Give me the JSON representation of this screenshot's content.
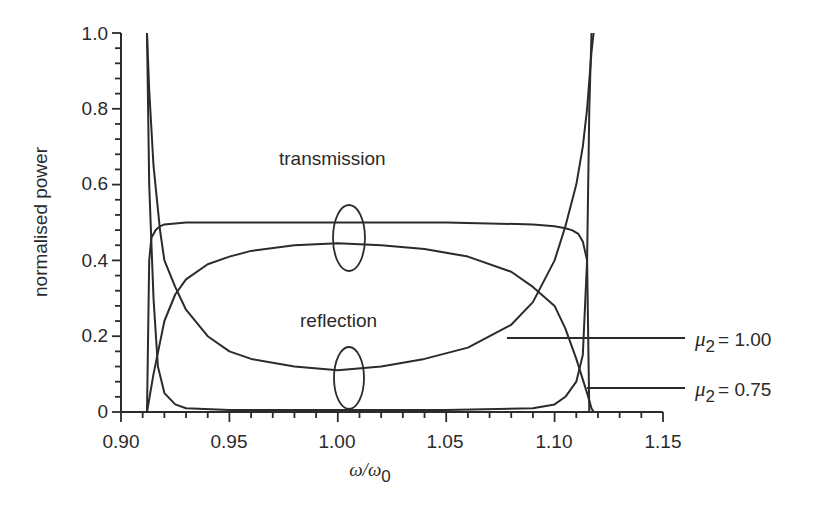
{
  "chart_data": {
    "type": "line",
    "title": "",
    "xlabel": "ω/ω0",
    "xlabel_main": "ω/ω",
    "xlabel_sub": "0",
    "ylabel": "normalised power",
    "xlim": [
      0.9,
      1.15
    ],
    "ylim": [
      0,
      1.0
    ],
    "grid": false,
    "x_ticks": [
      "0.90",
      "0.95",
      "1.00",
      "1.05",
      "1.10",
      "1.15"
    ],
    "x_tick_values": [
      0.9,
      0.95,
      1.0,
      1.05,
      1.1,
      1.15
    ],
    "y_ticks": [
      "0",
      "0.2",
      "0.4",
      "0.6",
      "0.8",
      "1.0"
    ],
    "y_tick_values": [
      0,
      0.2,
      0.4,
      0.6,
      0.8,
      1.0
    ],
    "annotations": {
      "transmission": "transmission",
      "reflection": "reflection",
      "mu_symbol": "μ",
      "mu_sub": "2",
      "mu_100_value": "= 1.00",
      "mu_075_value": "= 0.75"
    },
    "series": [
      {
        "name": "transmission μ2 = 0.75",
        "x": [
          0.912,
          0.913,
          0.914,
          0.916,
          0.918,
          0.92,
          0.93,
          0.95,
          1.0,
          1.05,
          1.09,
          1.1,
          1.105,
          1.108,
          1.111,
          1.113,
          1.115,
          1.116
        ],
        "y": [
          0.0,
          0.4,
          0.46,
          0.48,
          0.49,
          0.495,
          0.5,
          0.5,
          0.5,
          0.5,
          0.495,
          0.49,
          0.485,
          0.48,
          0.47,
          0.45,
          0.4,
          0.0
        ]
      },
      {
        "name": "reflection μ2 = 0.75",
        "x": [
          0.912,
          0.913,
          0.915,
          0.917,
          0.92,
          0.925,
          0.93,
          0.95,
          1.0,
          1.05,
          1.09,
          1.1,
          1.105,
          1.11,
          1.113,
          1.115,
          1.116,
          1.117
        ],
        "y": [
          1.0,
          0.6,
          0.3,
          0.12,
          0.05,
          0.02,
          0.01,
          0.005,
          0.005,
          0.005,
          0.01,
          0.02,
          0.04,
          0.08,
          0.15,
          0.4,
          0.8,
          1.0
        ]
      },
      {
        "name": "transmission μ2 = 1.00",
        "x": [
          0.912,
          0.915,
          0.92,
          0.925,
          0.93,
          0.94,
          0.95,
          0.96,
          0.98,
          1.0,
          1.02,
          1.04,
          1.06,
          1.08,
          1.09,
          1.1,
          1.105,
          1.11,
          1.115,
          1.117,
          1.118
        ],
        "y": [
          0.0,
          0.1,
          0.24,
          0.31,
          0.35,
          0.39,
          0.41,
          0.425,
          0.44,
          0.445,
          0.44,
          0.43,
          0.41,
          0.37,
          0.33,
          0.28,
          0.22,
          0.14,
          0.05,
          0.01,
          0.0
        ]
      },
      {
        "name": "reflection μ2 = 1.00",
        "x": [
          0.912,
          0.913,
          0.915,
          0.918,
          0.92,
          0.925,
          0.93,
          0.94,
          0.95,
          0.96,
          0.98,
          1.0,
          1.02,
          1.04,
          1.06,
          1.08,
          1.09,
          1.1,
          1.105,
          1.11,
          1.113,
          1.115,
          1.117,
          1.118
        ],
        "y": [
          1.0,
          0.85,
          0.65,
          0.48,
          0.4,
          0.33,
          0.27,
          0.2,
          0.16,
          0.14,
          0.12,
          0.11,
          0.12,
          0.14,
          0.17,
          0.23,
          0.29,
          0.4,
          0.49,
          0.6,
          0.7,
          0.8,
          0.95,
          1.0
        ]
      }
    ]
  }
}
